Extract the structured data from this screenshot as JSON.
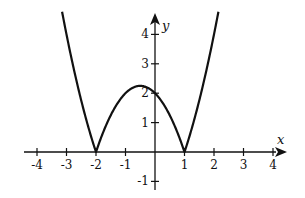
{
  "chart_data": {
    "type": "line",
    "title": "",
    "function": "y = |x^2 + x - 2|",
    "xlabel": "x",
    "ylabel": "y",
    "xlim": [
      -4.5,
      4.5
    ],
    "ylim": [
      -1.3,
      4.7
    ],
    "grid": false,
    "legend": null,
    "x_ticks": [
      -4,
      -3,
      -2,
      -1,
      1,
      2,
      3,
      4
    ],
    "x_tick_labels": [
      "-4",
      "-3",
      "-2",
      "-1",
      "1",
      "2",
      "3",
      "4"
    ],
    "y_ticks": [
      -1,
      1,
      2,
      3,
      4
    ],
    "y_tick_labels": [
      "-1",
      "1",
      "2",
      "3",
      "4"
    ],
    "series": [
      {
        "name": "|x^2 + x - 2|",
        "x": [
          -3.15,
          -3,
          -2.5,
          -2,
          -1.5,
          -1,
          -0.5,
          0,
          0.5,
          1,
          1.5,
          2,
          2.15
        ],
        "values": [
          4.77,
          4,
          1.75,
          0,
          1.25,
          2,
          2.25,
          2,
          1.25,
          0,
          1.75,
          4,
          4.77
        ]
      }
    ],
    "annotations": {
      "zeros": [
        -2,
        1
      ],
      "local_max": {
        "x": -0.5,
        "y": 2.25
      },
      "y_intercept": 2
    }
  },
  "colors": {
    "curve": "#111111",
    "axes": "#111111",
    "background": "#ffffff"
  }
}
